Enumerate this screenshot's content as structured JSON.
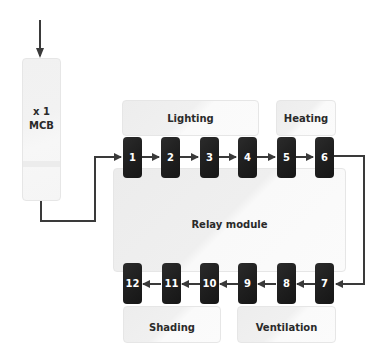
{
  "diagram": {
    "mcb": {
      "line1": "x 1",
      "line2": "MCB"
    },
    "relay_module": {
      "label": "Relay module"
    },
    "groups": {
      "lighting": "Lighting",
      "heating": "Heating",
      "shading": "Shading",
      "ventilation": "Ventilation"
    },
    "terminals_top": [
      "1",
      "2",
      "3",
      "4",
      "5",
      "6"
    ],
    "terminals_bottom": [
      "12",
      "11",
      "10",
      "9",
      "8",
      "7"
    ],
    "colors": {
      "terminal": "#1e1e1e",
      "wire": "#3a3a3a",
      "box": "#f0f0f0",
      "text": "#2a2a2a"
    }
  }
}
